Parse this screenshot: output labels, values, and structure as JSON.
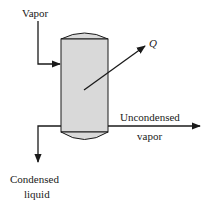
{
  "diagram": {
    "colors": {
      "line": "#1a1a1a",
      "vessel_fill": "#d9d9d9",
      "background": "#ffffff"
    },
    "labels": {
      "vapor_in": "Vapor",
      "heat": "Q",
      "uncondensed_line1": "Uncondensed",
      "uncondensed_line2": "vapor",
      "condensed_line1": "Condensed",
      "condensed_line2": "liquid"
    },
    "nodes": [
      {
        "id": "vessel",
        "shape": "cylindrical vessel with domed heads"
      }
    ],
    "edges": [
      {
        "from": "Vapor",
        "to": "vessel",
        "direction": "in"
      },
      {
        "from": "vessel",
        "to": "Q",
        "direction": "out"
      },
      {
        "from": "vessel",
        "to": "Uncondensed vapor",
        "direction": "out"
      },
      {
        "from": "vessel",
        "to": "Condensed liquid",
        "direction": "out"
      }
    ]
  }
}
